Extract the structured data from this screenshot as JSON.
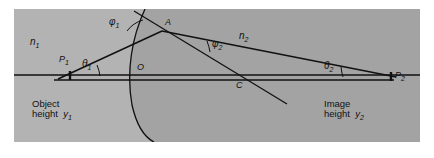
{
  "figure": {
    "kind": "optics-ray-diagram",
    "background_color": "#b3b3b3",
    "medium1_fill": "#b3b3b3",
    "medium2_fill": "#a0a0a0",
    "line_color": "#111111",
    "page_color": "#ffffff"
  },
  "media": {
    "left": {
      "label": "n",
      "sub": "1"
    },
    "right": {
      "label": "n",
      "sub": "2"
    }
  },
  "points": {
    "p1": {
      "label": "P",
      "sub": "1"
    },
    "p2": {
      "label": "P",
      "sub": "2"
    },
    "vertex": {
      "label": "O",
      "sub": ""
    },
    "incidence": {
      "label": "A",
      "sub": ""
    },
    "center": {
      "label": "C",
      "sub": ""
    }
  },
  "angles": {
    "theta1": {
      "label": "θ",
      "sub": "1"
    },
    "theta2": {
      "label": "θ",
      "sub": "2"
    },
    "phi1": {
      "label": "φ",
      "sub": "1"
    },
    "phi2": {
      "label": "φ",
      "sub": "2"
    }
  },
  "captions": {
    "object_line1": "Object",
    "object_line2": "height",
    "object_symbol": "y",
    "object_sub": "1",
    "image_line1": "Image",
    "image_line2": "height",
    "image_symbol": "y",
    "image_sub": "2"
  }
}
